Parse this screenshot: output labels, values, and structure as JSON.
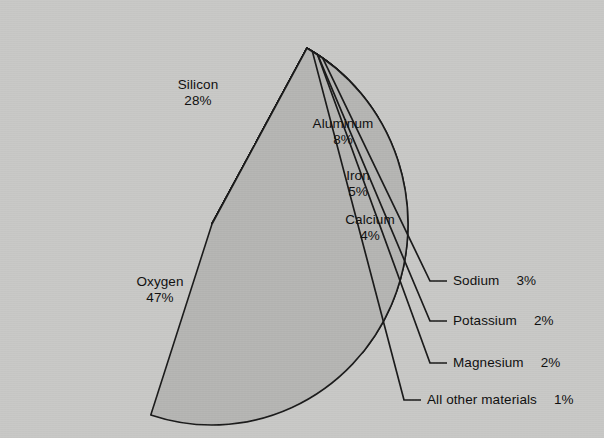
{
  "chart_data": {
    "type": "pie",
    "title": "",
    "subtitle": "",
    "xlabel": "",
    "ylabel": "",
    "legend_position": "none",
    "grid": false,
    "unit": "%",
    "background_color": "#c9c9c7",
    "outline_color": "#1b1b1b",
    "categories": [
      "Silicon",
      "Aluminum",
      "Iron",
      "Calcium",
      "Sodium",
      "Potassium",
      "Magnesium",
      "All other materials",
      "Oxygen"
    ],
    "values": [
      28,
      8,
      5,
      4,
      3,
      2,
      2,
      1,
      47
    ],
    "slices": [
      {
        "name": "Silicon",
        "value": 28,
        "value_label": "28%",
        "color": "#a9a9a7",
        "label_placement": "inside",
        "label_x": 198,
        "label_y": 85
      },
      {
        "name": "Aluminum",
        "value": 8,
        "value_label": "8%",
        "color": "#b5b5b3",
        "label_placement": "inside",
        "label_x": 343,
        "label_y": 124
      },
      {
        "name": "Iron",
        "value": 5,
        "value_label": "5%",
        "color": "#8b8b89",
        "label_placement": "inside",
        "label_x": 358,
        "label_y": 176
      },
      {
        "name": "Calcium",
        "value": 4,
        "value_label": "4%",
        "color": "#c6c6c4",
        "label_placement": "inside",
        "label_x": 370,
        "label_y": 220
      },
      {
        "name": "Sodium",
        "value": 3,
        "value_label": "3%",
        "color": "#b1b1af",
        "label_placement": "callout",
        "label_x": 453,
        "label_y": 281
      },
      {
        "name": "Potassium",
        "value": 2,
        "value_label": "2%",
        "color": "#bfbfbd",
        "label_placement": "callout",
        "label_x": 453,
        "label_y": 321
      },
      {
        "name": "Magnesium",
        "value": 2,
        "value_label": "2%",
        "color": "#919190",
        "label_placement": "callout",
        "label_x": 453,
        "label_y": 363
      },
      {
        "name": "All other materials",
        "value": 1,
        "value_label": "1%",
        "color": "#7f7f7e",
        "label_placement": "callout",
        "label_x": 427,
        "label_y": 400
      },
      {
        "name": "Oxygen",
        "value": 47,
        "value_label": "47%",
        "color": "#b6b6b4",
        "label_placement": "inside",
        "label_x": 160,
        "label_y": 282
      }
    ],
    "geometry": {
      "center_x": 212,
      "center_y": 224,
      "radius_x": 196,
      "radius_y": 201,
      "start_angle_deg": -61
    }
  }
}
